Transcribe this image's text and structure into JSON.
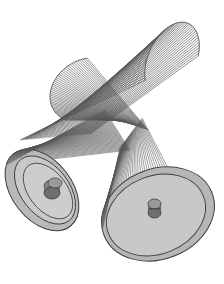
{
  "figure": {
    "colors": {
      "background": "#ffffff",
      "string": "#555555",
      "disk_face": "#c8c8c8",
      "disk_rim": "#b4b4b4",
      "disk_outline": "#3c3c3c",
      "hub": "#7a7a7a",
      "hub_top": "#9a9a9a"
    },
    "components": [
      {
        "name": "upper-right-string-fan"
      },
      {
        "name": "upper-left-string-fan"
      },
      {
        "name": "left-disk"
      },
      {
        "name": "right-disk"
      },
      {
        "name": "left-hub"
      },
      {
        "name": "right-hub"
      }
    ],
    "string_count": 48
  }
}
